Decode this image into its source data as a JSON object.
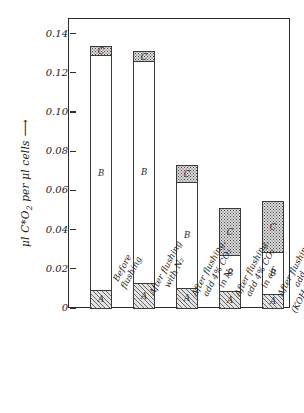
{
  "chart_data": {
    "type": "bar",
    "subtype": "stacked-bar",
    "title": "",
    "xlabel": "",
    "ylabel": "μl C*O₂ per μl cells",
    "ylabel_has_arrow": true,
    "ylim": [
      0,
      0.148
    ],
    "yticks": [
      0,
      0.02,
      0.04,
      0.06,
      0.08,
      0.1,
      0.12,
      0.14
    ],
    "ytick_labels": [
      "0",
      "0.02",
      "0.04",
      "0.06",
      "0.08",
      "0.10",
      "0.12",
      "0.14"
    ],
    "grid": false,
    "legend": "none",
    "categories": [
      "Before flushing",
      "After flushing with N₂",
      "After flushing, add 4% CO₂ in N₂",
      "After flushing, add 4% CO₂ in air",
      "After flushing, add air (KOH in side arm)"
    ],
    "series": [
      {
        "name": "A",
        "label": "A",
        "fill": "hatched",
        "values": [
          0.0097,
          0.0133,
          0.0107,
          0.0092,
          0.0077
        ]
      },
      {
        "name": "B",
        "label": "B",
        "fill": "white",
        "values": [
          0.1203,
          0.1137,
          0.0548,
          0.0188,
          0.0218
        ]
      },
      {
        "name": "C",
        "label": "C",
        "fill": "stippled",
        "values": [
          0.0055,
          0.0055,
          0.009,
          0.0245,
          0.0265
        ]
      }
    ],
    "totals": [
      0.1355,
      0.1325,
      0.0745,
      0.0525,
      0.056
    ]
  },
  "axis": {
    "y_title_parts": {
      "pre": "μl C*O",
      "sub": "2",
      "post": " per μl cells"
    },
    "arrow_glyph": "⟶"
  },
  "x_labels": [
    {
      "lines": [
        "Before",
        "flushing"
      ]
    },
    {
      "lines": [
        "After flushing",
        "with N₂"
      ]
    },
    {
      "lines": [
        "After flushing,",
        "add 4% CO₂",
        "in N₂"
      ]
    },
    {
      "lines": [
        "After flushing,",
        "add 4% CO₂",
        "in air"
      ]
    },
    {
      "lines": [
        "After flushing,",
        "add air",
        "(KOH in side arm)"
      ]
    }
  ],
  "colors": {
    "axis": "#2b2b2b",
    "segment_a": "#e3e3e3",
    "segment_b": "#ffffff",
    "segment_c": "#dcdcdc",
    "text": "#1a1a1a"
  }
}
